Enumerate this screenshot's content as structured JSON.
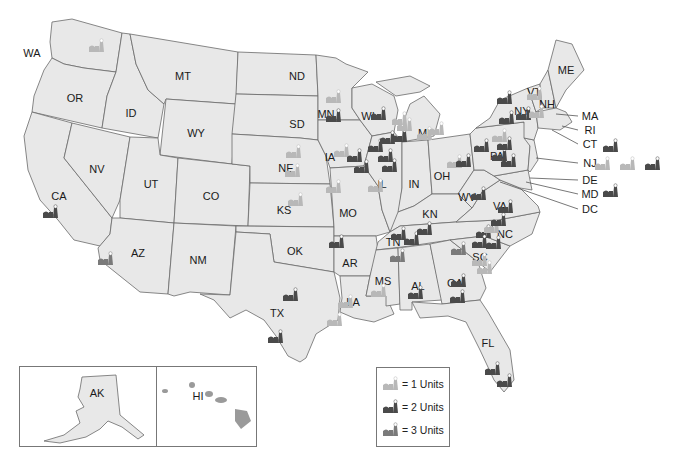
{
  "colors": {
    "state_fill": "#e8e8e8",
    "border": "#6a6a6a",
    "units_1": "#b8b8b8",
    "units_2": "#4a4a4a",
    "units_3": "#7a7a7a"
  },
  "states": [
    {
      "abbr": "WA",
      "x": 32,
      "y": 53
    },
    {
      "abbr": "OR",
      "x": 75,
      "y": 98
    },
    {
      "abbr": "ID",
      "x": 131,
      "y": 113
    },
    {
      "abbr": "MT",
      "x": 183,
      "y": 76
    },
    {
      "abbr": "ND",
      "x": 297,
      "y": 76
    },
    {
      "abbr": "SD",
      "x": 297,
      "y": 124
    },
    {
      "abbr": "WY",
      "x": 196,
      "y": 133
    },
    {
      "abbr": "NV",
      "x": 97,
      "y": 169
    },
    {
      "abbr": "UT",
      "x": 151,
      "y": 184
    },
    {
      "abbr": "CO",
      "x": 211,
      "y": 196
    },
    {
      "abbr": "CA",
      "x": 59,
      "y": 196
    },
    {
      "abbr": "NE",
      "x": 286,
      "y": 168
    },
    {
      "abbr": "KS",
      "x": 284,
      "y": 210
    },
    {
      "abbr": "OK",
      "x": 295,
      "y": 251
    },
    {
      "abbr": "AZ",
      "x": 138,
      "y": 253
    },
    {
      "abbr": "NM",
      "x": 198,
      "y": 260
    },
    {
      "abbr": "TX",
      "x": 277,
      "y": 313
    },
    {
      "abbr": "MN",
      "x": 326,
      "y": 114
    },
    {
      "abbr": "IA",
      "x": 330,
      "y": 157
    },
    {
      "abbr": "MO",
      "x": 348,
      "y": 213
    },
    {
      "abbr": "AR",
      "x": 350,
      "y": 263
    },
    {
      "abbr": "LA",
      "x": 353,
      "y": 302
    },
    {
      "abbr": "WI",
      "x": 368,
      "y": 116
    },
    {
      "abbr": "IL",
      "x": 382,
      "y": 184
    },
    {
      "abbr": "MI",
      "x": 424,
      "y": 133
    },
    {
      "abbr": "IN",
      "x": 414,
      "y": 184
    },
    {
      "abbr": "OH",
      "x": 442,
      "y": 176
    },
    {
      "abbr": "KN",
      "x": 430,
      "y": 214
    },
    {
      "abbr": "TN",
      "x": 393,
      "y": 242
    },
    {
      "abbr": "MS",
      "x": 383,
      "y": 281
    },
    {
      "abbr": "AL",
      "x": 418,
      "y": 286
    },
    {
      "abbr": "GA",
      "x": 455,
      "y": 283
    },
    {
      "abbr": "FL",
      "x": 488,
      "y": 343
    },
    {
      "abbr": "SC",
      "x": 480,
      "y": 257
    },
    {
      "abbr": "NC",
      "x": 505,
      "y": 234
    },
    {
      "abbr": "VA",
      "x": 500,
      "y": 206
    },
    {
      "abbr": "WV",
      "x": 467,
      "y": 197
    },
    {
      "abbr": "PA",
      "x": 497,
      "y": 156
    },
    {
      "abbr": "NY",
      "x": 522,
      "y": 111
    },
    {
      "abbr": "VT",
      "x": 534,
      "y": 92
    },
    {
      "abbr": "NH",
      "x": 547,
      "y": 104
    },
    {
      "abbr": "ME",
      "x": 566,
      "y": 70
    },
    {
      "abbr": "AK",
      "x": 96,
      "y": 392
    },
    {
      "abbr": "HI",
      "x": 197,
      "y": 395
    }
  ],
  "callouts": [
    {
      "abbr": "MA",
      "x": 590,
      "y": 116
    },
    {
      "abbr": "RI",
      "x": 590,
      "y": 130
    },
    {
      "abbr": "CT",
      "x": 590,
      "y": 144
    },
    {
      "abbr": "NJ",
      "x": 590,
      "y": 163
    },
    {
      "abbr": "DE",
      "x": 590,
      "y": 180
    },
    {
      "abbr": "MD",
      "x": 590,
      "y": 194
    },
    {
      "abbr": "DC",
      "x": 590,
      "y": 209
    }
  ],
  "plants": [
    {
      "x": 97,
      "y": 45,
      "units": 1
    },
    {
      "x": 51,
      "y": 211,
      "units": 2
    },
    {
      "x": 106,
      "y": 258,
      "units": 3
    },
    {
      "x": 291,
      "y": 294,
      "units": 2
    },
    {
      "x": 276,
      "y": 336,
      "units": 2
    },
    {
      "x": 296,
      "y": 199,
      "units": 1
    },
    {
      "x": 337,
      "y": 241,
      "units": 2
    },
    {
      "x": 346,
      "y": 301,
      "units": 1
    },
    {
      "x": 335,
      "y": 319,
      "units": 1
    },
    {
      "x": 334,
      "y": 186,
      "units": 1
    },
    {
      "x": 334,
      "y": 96,
      "units": 1
    },
    {
      "x": 334,
      "y": 115,
      "units": 2
    },
    {
      "x": 294,
      "y": 151,
      "units": 1
    },
    {
      "x": 293,
      "y": 170,
      "units": 1
    },
    {
      "x": 342,
      "y": 150,
      "units": 1
    },
    {
      "x": 355,
      "y": 155,
      "units": 2
    },
    {
      "x": 362,
      "y": 166,
      "units": 2
    },
    {
      "x": 376,
      "y": 145,
      "units": 2
    },
    {
      "x": 386,
      "y": 155,
      "units": 2
    },
    {
      "x": 388,
      "y": 137,
      "units": 2
    },
    {
      "x": 379,
      "y": 113,
      "units": 2
    },
    {
      "x": 390,
      "y": 165,
      "units": 2
    },
    {
      "x": 376,
      "y": 185,
      "units": 1
    },
    {
      "x": 400,
      "y": 118,
      "units": 1
    },
    {
      "x": 400,
      "y": 135,
      "units": 2
    },
    {
      "x": 405,
      "y": 124,
      "units": 1
    },
    {
      "x": 425,
      "y": 133,
      "units": 1
    },
    {
      "x": 437,
      "y": 128,
      "units": 1
    },
    {
      "x": 399,
      "y": 233,
      "units": 2
    },
    {
      "x": 412,
      "y": 238,
      "units": 2
    },
    {
      "x": 425,
      "y": 228,
      "units": 2
    },
    {
      "x": 398,
      "y": 255,
      "units": 3
    },
    {
      "x": 379,
      "y": 290,
      "units": 1
    },
    {
      "x": 416,
      "y": 292,
      "units": 2
    },
    {
      "x": 459,
      "y": 280,
      "units": 2
    },
    {
      "x": 458,
      "y": 296,
      "units": 2
    },
    {
      "x": 459,
      "y": 248,
      "units": 3
    },
    {
      "x": 484,
      "y": 231,
      "units": 2
    },
    {
      "x": 480,
      "y": 241,
      "units": 2
    },
    {
      "x": 494,
      "y": 242,
      "units": 2
    },
    {
      "x": 492,
      "y": 226,
      "units": 1
    },
    {
      "x": 480,
      "y": 259,
      "units": 1
    },
    {
      "x": 485,
      "y": 267,
      "units": 1
    },
    {
      "x": 499,
      "y": 219,
      "units": 2
    },
    {
      "x": 506,
      "y": 206,
      "units": 2
    },
    {
      "x": 479,
      "y": 193,
      "units": 2
    },
    {
      "x": 509,
      "y": 160,
      "units": 2
    },
    {
      "x": 500,
      "y": 154,
      "units": 2
    },
    {
      "x": 482,
      "y": 145,
      "units": 2
    },
    {
      "x": 500,
      "y": 135,
      "units": 1
    },
    {
      "x": 505,
      "y": 143,
      "units": 2
    },
    {
      "x": 507,
      "y": 117,
      "units": 2
    },
    {
      "x": 505,
      "y": 97,
      "units": 2
    },
    {
      "x": 524,
      "y": 113,
      "units": 2
    },
    {
      "x": 537,
      "y": 111,
      "units": 1
    },
    {
      "x": 535,
      "y": 93,
      "units": 1
    },
    {
      "x": 455,
      "y": 161,
      "units": 1
    },
    {
      "x": 464,
      "y": 160,
      "units": 2
    },
    {
      "x": 493,
      "y": 368,
      "units": 2
    },
    {
      "x": 505,
      "y": 380,
      "units": 2
    },
    {
      "x": 611,
      "y": 145,
      "units": 2
    },
    {
      "x": 603,
      "y": 163,
      "units": 1
    },
    {
      "x": 628,
      "y": 163,
      "units": 1
    },
    {
      "x": 653,
      "y": 163,
      "units": 2
    },
    {
      "x": 611,
      "y": 190,
      "units": 2
    }
  ],
  "legend": {
    "items": [
      {
        "label": "= 1 Units",
        "units": 1
      },
      {
        "label": "= 2 Units",
        "units": 2
      },
      {
        "label": "= 3 Units",
        "units": 3
      }
    ]
  },
  "insets": {
    "alaska_label": "AK",
    "hawaii_label": "HI"
  }
}
